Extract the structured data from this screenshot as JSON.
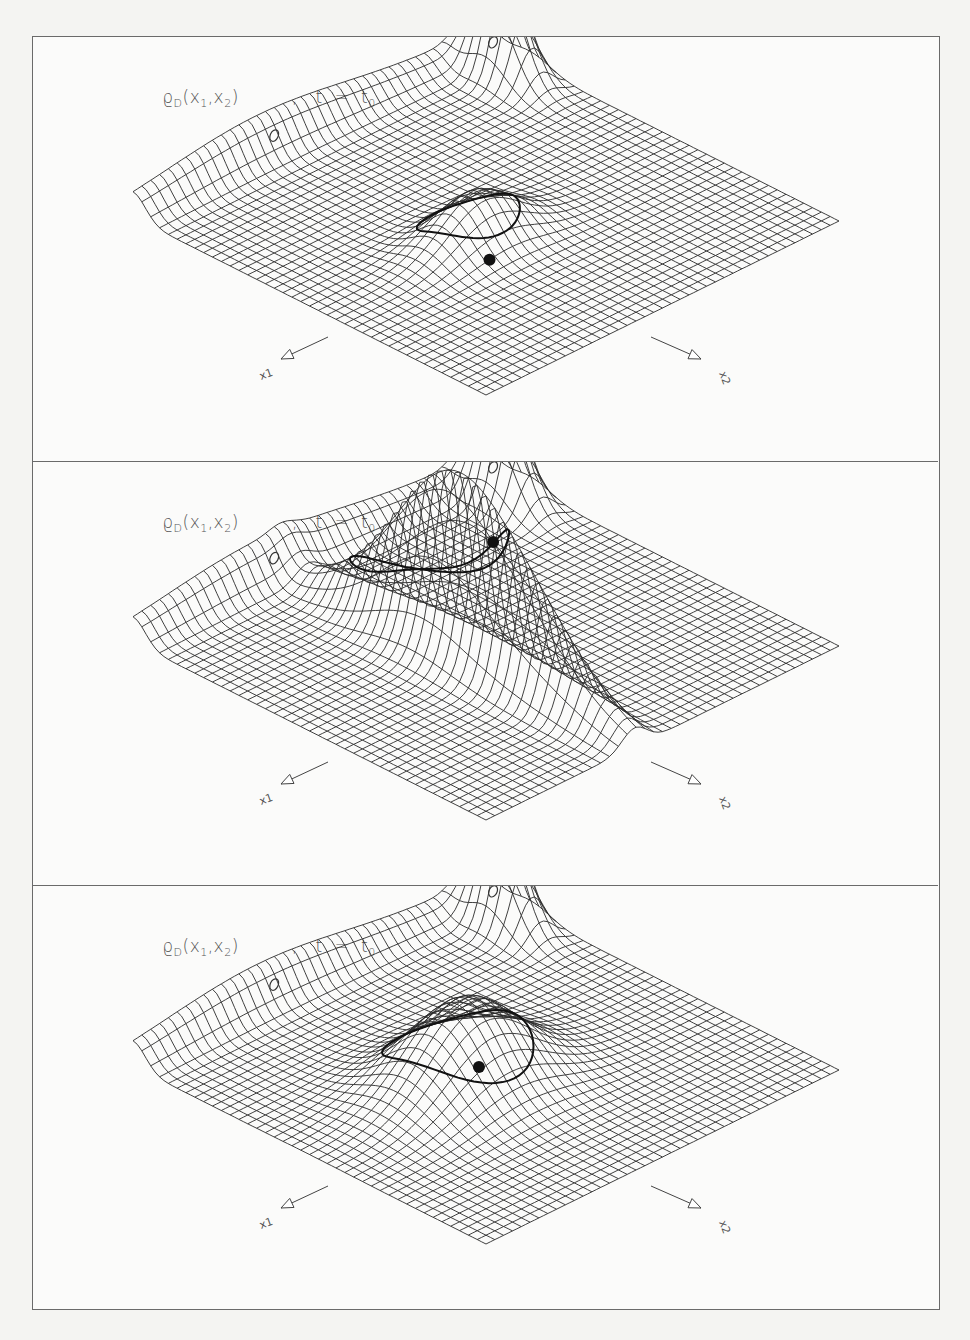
{
  "figure": {
    "panels": [
      {
        "id": "panel-1",
        "label": {
          "function": "ϱ",
          "function_sub": "D",
          "args": "(x",
          "arg1_sub": "1",
          "args_mid": ",x",
          "arg2_sub": "2",
          "args_end": ")",
          "separator": ",",
          "time_eq": "t  =  t",
          "time_sub": "0"
        },
        "axes": {
          "x1": "x1",
          "x2": "x2"
        },
        "surface": {
          "variant": "broad-ellipse",
          "central_bump": {
            "cx": 0.42,
            "cy": 0.55,
            "sx": 0.1,
            "sy": 0.06,
            "h": 0.55
          },
          "marker_zero_count": 2,
          "black_dot": true,
          "ellipse_contour": true
        }
      },
      {
        "id": "panel-2",
        "label": {
          "function": "ϱ",
          "function_sub": "D",
          "args": "(x",
          "arg1_sub": "1",
          "args_mid": ",x",
          "arg2_sub": "2",
          "args_end": ")",
          "separator": ",",
          "time_eq": "t  =  t",
          "time_sub": "0"
        },
        "axes": {
          "x1": "x1",
          "x2": "x2"
        },
        "surface": {
          "variant": "sharp-ridge",
          "central_bump": {
            "cx": 0.45,
            "cy": 0.45,
            "sx": 0.04,
            "sy": 0.2,
            "h": 1.9
          },
          "marker_zero_count": 2,
          "black_dot": true,
          "ellipse_contour": true
        }
      },
      {
        "id": "panel-3",
        "label": {
          "function": "ϱ",
          "function_sub": "D",
          "args": "(x",
          "arg1_sub": "1",
          "args_mid": ",x",
          "arg2_sub": "2",
          "args_end": ")",
          "separator": ",",
          "time_eq": "t  =  t",
          "time_sub": "0"
        },
        "axes": {
          "x1": "x1",
          "x2": "x2"
        },
        "surface": {
          "variant": "wide-bump",
          "central_bump": {
            "cx": 0.42,
            "cy": 0.52,
            "sx": 0.13,
            "sy": 0.1,
            "h": 0.95
          },
          "marker_zero_count": 2,
          "black_dot": true,
          "ellipse_contour": true
        }
      }
    ],
    "colors": {
      "line": "#2a2a2a",
      "frame": "#6a6a6a",
      "label": "#555555",
      "background": "#fbfbfa",
      "page": "#f4f4f2"
    }
  }
}
